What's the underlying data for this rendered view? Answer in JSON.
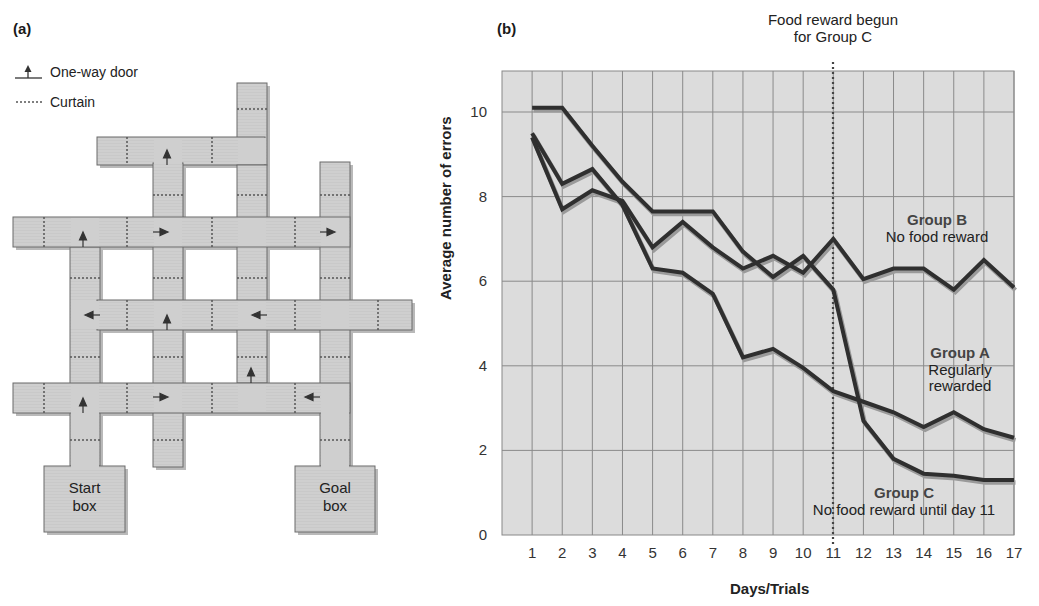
{
  "panel_a": {
    "label": "(a)",
    "legend": [
      {
        "icon": "one-way-door-icon",
        "text": "One-way door"
      },
      {
        "icon": "curtain-icon",
        "text": "Curtain"
      }
    ],
    "start_box": {
      "line1": "Start",
      "line2": "box"
    },
    "goal_box": {
      "line1": "Goal",
      "line2": "box"
    }
  },
  "panel_b": {
    "label": "(b)",
    "annotation_top": {
      "line1": "Food reward begun",
      "line2": "for Group C"
    },
    "group_b": {
      "name": "Group B",
      "desc": "No food reward"
    },
    "group_a": {
      "name": "Group A",
      "line1": "Regularly",
      "line2": "rewarded"
    },
    "group_c": {
      "name": "Group C",
      "desc": "No food reward until day 11"
    }
  },
  "colors": {
    "maze_fill": "#cfcfcf",
    "maze_edge": "#6a6a6a",
    "chart_bg": "#dcdcdc",
    "grid": "#8a8a8a",
    "line": "#2f2f2f",
    "line_shadow": "#9a9a9a"
  },
  "chart_data": {
    "type": "line",
    "title": "",
    "xlabel": "Days/Trials",
    "ylabel": "Average number of errors",
    "x": [
      1,
      2,
      3,
      4,
      5,
      6,
      7,
      8,
      9,
      10,
      11,
      12,
      13,
      14,
      15,
      16,
      17
    ],
    "xlim": [
      0,
      17
    ],
    "ylim": [
      0,
      11
    ],
    "yticks": [
      0,
      2,
      4,
      6,
      8,
      10
    ],
    "grid": true,
    "legend_position": "inline annotations",
    "series": [
      {
        "name": "Group A",
        "label": "Regularly rewarded",
        "values": [
          9.5,
          8.3,
          8.65,
          7.8,
          6.3,
          6.2,
          5.7,
          4.2,
          4.4,
          3.95,
          3.4,
          3.15,
          2.9,
          2.55,
          2.9,
          2.5,
          2.3
        ]
      },
      {
        "name": "Group B",
        "label": "No food reward",
        "values": [
          9.4,
          7.7,
          8.15,
          7.9,
          6.8,
          7.4,
          6.8,
          6.3,
          6.6,
          6.2,
          7.0,
          6.05,
          6.3,
          6.3,
          5.8,
          6.5,
          5.85
        ]
      },
      {
        "name": "Group C",
        "label": "No food reward until day 11",
        "values": [
          10.1,
          10.1,
          9.2,
          8.35,
          7.65,
          7.65,
          7.65,
          6.7,
          6.1,
          6.6,
          5.8,
          2.7,
          1.8,
          1.45,
          1.4,
          1.3,
          1.3
        ]
      }
    ],
    "annotations": [
      {
        "text": "Food reward begun for Group C",
        "x": 11,
        "style": "dotted vertical line"
      }
    ]
  }
}
